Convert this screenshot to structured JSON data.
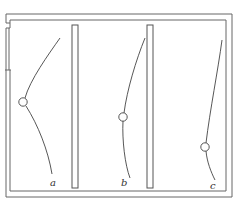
{
  "diagram": {
    "stroke_color": "#555555",
    "curves": [
      {
        "id": "a",
        "label": "a"
      },
      {
        "id": "b",
        "label": "b"
      },
      {
        "id": "c",
        "label": "c"
      }
    ]
  }
}
